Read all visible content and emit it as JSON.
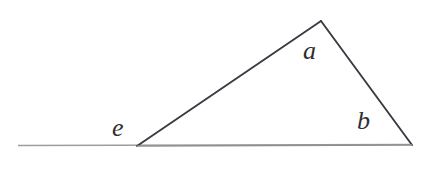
{
  "figure": {
    "background_color": "#ffffff",
    "width": 426,
    "height": 173,
    "baseline": {
      "name": "horizontal-baseline",
      "color": "#9d9d9d",
      "stroke_width": 1.6,
      "x1": 18,
      "y1": 145.5,
      "x2": 410,
      "y2": 144.5
    },
    "triangle": {
      "name": "triangle",
      "color": "#3a3a42",
      "stroke_width": 1.9,
      "vertices": {
        "apex": {
          "x": 321,
          "y": 21
        },
        "left": {
          "x": 137,
          "y": 146
        },
        "right": {
          "x": 412,
          "y": 145
        }
      },
      "sides": [
        {
          "name": "left-side",
          "from": "left",
          "to": "apex"
        },
        {
          "name": "right-side",
          "from": "apex",
          "to": "right"
        },
        {
          "name": "base-side",
          "from": "left",
          "to": "right"
        }
      ]
    },
    "labels": [
      {
        "id": "a",
        "text": "a",
        "name": "angle-label-a",
        "x": 312,
        "y": 53,
        "describes": "interior angle at apex"
      },
      {
        "id": "b",
        "text": "b",
        "name": "angle-label-b",
        "x": 366,
        "y": 124,
        "describes": "interior angle at right vertex"
      },
      {
        "id": "e",
        "text": "e",
        "name": "angle-label-e",
        "x": 122,
        "y": 130,
        "describes": "exterior angle at left vertex"
      }
    ]
  }
}
